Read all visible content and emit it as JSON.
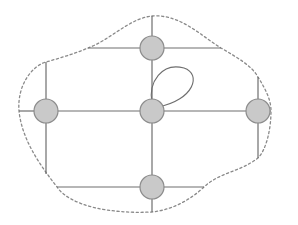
{
  "diagram": {
    "type": "planar-graph-with-region",
    "width": 298,
    "height": 225,
    "colors": {
      "node_fill": "#c9c9c9",
      "node_stroke": "#8c8c8c",
      "edge": "#6e6e6e",
      "boundary": "#8a8a8a",
      "background": "#ffffff"
    },
    "node_radius": 12,
    "nodes": [
      {
        "id": "top",
        "x": 152,
        "y": 48
      },
      {
        "id": "left",
        "x": 46,
        "y": 111
      },
      {
        "id": "center",
        "x": 152,
        "y": 111
      },
      {
        "id": "right",
        "x": 258,
        "y": 111
      },
      {
        "id": "bottom",
        "x": 152,
        "y": 187
      }
    ],
    "edges": [
      {
        "id": "top-stub-up",
        "x1": 152,
        "y1": 16,
        "x2": 152,
        "y2": 48
      },
      {
        "id": "top-to-center",
        "x1": 152,
        "y1": 48,
        "x2": 152,
        "y2": 111
      },
      {
        "id": "center-to-bottom",
        "x1": 152,
        "y1": 111,
        "x2": 152,
        "y2": 187
      },
      {
        "id": "bottom-stub-down",
        "x1": 152,
        "y1": 187,
        "x2": 152,
        "y2": 212
      },
      {
        "id": "top-horizontal-left",
        "x1": 88,
        "y1": 48,
        "x2": 152,
        "y2": 48
      },
      {
        "id": "top-horizontal-right",
        "x1": 152,
        "y1": 48,
        "x2": 221,
        "y2": 48
      },
      {
        "id": "mid-stub-left",
        "x1": 19,
        "y1": 111,
        "x2": 46,
        "y2": 111
      },
      {
        "id": "left-to-center",
        "x1": 46,
        "y1": 111,
        "x2": 152,
        "y2": 111
      },
      {
        "id": "center-to-right",
        "x1": 152,
        "y1": 111,
        "x2": 258,
        "y2": 111
      },
      {
        "id": "mid-stub-right",
        "x1": 258,
        "y1": 111,
        "x2": 271,
        "y2": 111
      },
      {
        "id": "left-stub-up",
        "x1": 46,
        "y1": 62,
        "x2": 46,
        "y2": 111
      },
      {
        "id": "left-stub-down",
        "x1": 46,
        "y1": 111,
        "x2": 46,
        "y2": 174
      },
      {
        "id": "right-stub-up",
        "x1": 258,
        "y1": 77,
        "x2": 258,
        "y2": 111
      },
      {
        "id": "right-stub-down",
        "x1": 258,
        "y1": 111,
        "x2": 258,
        "y2": 158
      },
      {
        "id": "bottom-horizontal-left",
        "x1": 57,
        "y1": 187,
        "x2": 152,
        "y2": 187
      },
      {
        "id": "bottom-horizontal-right",
        "x1": 152,
        "y1": 187,
        "x2": 204,
        "y2": 187
      }
    ],
    "loops": [
      {
        "id": "center-self-loop",
        "node": "center",
        "path": "M 152 103 C 148 82, 162 62, 184 68 C 202 74, 194 100, 158 107"
      }
    ],
    "boundary": {
      "style": "dashed",
      "path": "M 88 48 C 110 40, 130 18, 152 16 C 180 14, 200 35, 221 48 C 238 58, 252 66, 258 77 C 266 90, 271 100, 271 111 C 271 130, 266 150, 258 158 C 240 172, 220 172, 204 187 C 190 200, 172 210, 152 212 C 110 214, 70 206, 57 187 C 40 165, 22 140, 19 111 C 17 85, 32 66, 46 62 C 60 58, 74 54, 88 48 Z"
    }
  }
}
